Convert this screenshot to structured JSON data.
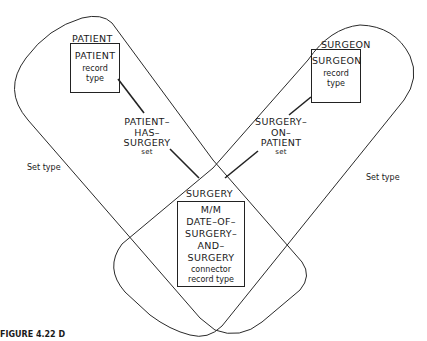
{
  "diagram": {
    "record_types": [
      {
        "name": "PATIENT",
        "box_title": "PATIENT",
        "box_subtitle_1": "record",
        "box_subtitle_2": "type"
      },
      {
        "name": "SURGEON",
        "box_title": "SURGEON",
        "box_subtitle_1": "record",
        "box_subtitle_2": "type"
      }
    ],
    "connector": {
      "name": "SURGERY",
      "lines": [
        "M/M",
        "DATE–OF–",
        "SURGERY–",
        "AND–",
        "SURGERY"
      ],
      "subtitle_1": "connector",
      "subtitle_2": "record type"
    },
    "sets": [
      {
        "lines": [
          "PATIENT–",
          "HAS–",
          "SURGERY"
        ],
        "suffix": "set"
      },
      {
        "lines": [
          "SURGERY–",
          "ON–",
          "PATIENT"
        ],
        "suffix": "set"
      }
    ],
    "set_type_labels": [
      "Set type",
      "Set type"
    ],
    "caption_fragment": "FIGURE 4.22  D"
  },
  "colors": {
    "line": "#2a2a2a",
    "background": "#ffffff",
    "text": "#1a1a1a"
  }
}
